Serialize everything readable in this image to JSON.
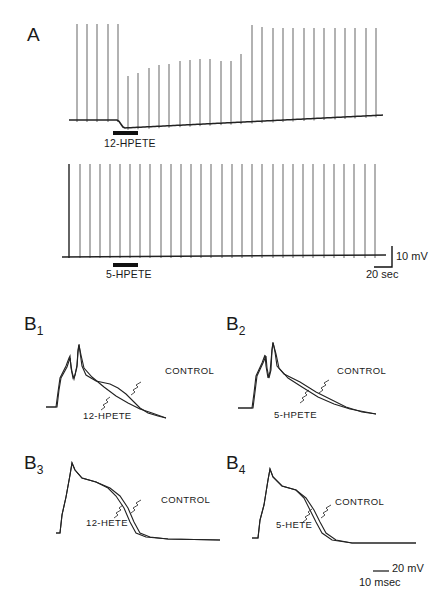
{
  "figure": {
    "panel_a": {
      "label": "A",
      "trace1": {
        "drug_label": "12-HPETE",
        "baseline_y": 120,
        "spike_top_before": 24,
        "spikes_x": [
          77,
          87,
          97,
          108,
          118,
          128,
          138,
          149,
          159,
          169,
          180,
          190,
          200,
          210,
          221,
          231,
          241,
          252,
          262,
          273,
          283,
          293,
          304,
          314,
          324,
          335,
          345,
          355,
          366,
          376
        ],
        "spike_tops": [
          24,
          24,
          24,
          24,
          24,
          76,
          73,
          68,
          65,
          64,
          61,
          60,
          59,
          59,
          61,
          61,
          54,
          25,
          27,
          28,
          28,
          28,
          28,
          28,
          28,
          28,
          28,
          28,
          28,
          28
        ]
      },
      "trace2": {
        "drug_label": "5-HPETE",
        "baseline_y": 257,
        "spike_top": 164,
        "spikes_x": [
          69,
          80,
          90,
          100,
          110,
          120,
          130,
          140,
          150,
          161,
          171,
          181,
          191,
          201,
          211,
          222,
          232,
          242,
          252,
          262,
          273,
          283,
          293,
          303,
          313,
          324,
          334,
          344,
          354,
          365,
          375
        ]
      },
      "scale_bar": {
        "voltage": "10 mV",
        "time": "20 sec"
      }
    },
    "panels_b": [
      {
        "label": "B",
        "sub": "1",
        "control_label": "CONTROL",
        "drug_label": "12-HPETE"
      },
      {
        "label": "B",
        "sub": "2",
        "control_label": "CONTROL",
        "drug_label": "5-HPETE"
      },
      {
        "label": "B",
        "sub": "3",
        "control_label": "CONTROL",
        "drug_label": "12-HETE"
      },
      {
        "label": "B",
        "sub": "4",
        "control_label": "CONTROL",
        "drug_label": "5-HETE"
      }
    ],
    "b_scale_bar": {
      "voltage": "20 mV",
      "time": "10 msec"
    }
  }
}
